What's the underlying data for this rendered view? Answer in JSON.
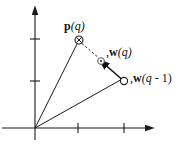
{
  "figure": {
    "type": "vector-diagram",
    "width": 182,
    "height": 154,
    "background": "#ffffff",
    "stroke_color": "#1a1a1a",
    "label_color": "#111111"
  },
  "axes": {
    "origin": {
      "x": 35,
      "y": 128
    },
    "x_axis": {
      "name": "horizontal-axis",
      "from": {
        "x": 2,
        "y": 128
      },
      "to": {
        "x": 152,
        "y": 128
      },
      "arrow": true,
      "ticks": [
        78,
        124
      ],
      "tick_half_length": 5
    },
    "y_axis": {
      "name": "vertical-axis",
      "from": {
        "x": 35,
        "y": 140
      },
      "to": {
        "x": 35,
        "y": 9
      },
      "arrow": true,
      "ticks": [
        39,
        81
      ],
      "tick_half_length": 5
    }
  },
  "markers": [
    {
      "id": "p-q",
      "glyph": "circle-with-cross",
      "x": 79,
      "y": 40,
      "radius": 4,
      "filled": false
    },
    {
      "id": "w-q",
      "glyph": "circle-with-dot",
      "x": 101,
      "y": 61,
      "radius": 3.2,
      "filled": false
    },
    {
      "id": "w-q-minus-1",
      "glyph": "open-circle",
      "x": 124,
      "y": 81,
      "radius": 3.4,
      "filled": false
    }
  ],
  "lines": [
    {
      "id": "origin-to-pq",
      "style": "solid",
      "from": {
        "x": 35,
        "y": 128
      },
      "to": {
        "x": 77,
        "y": 44
      }
    },
    {
      "id": "origin-to-wq-minus-1",
      "style": "solid",
      "from": {
        "x": 35,
        "y": 128
      },
      "to": {
        "x": 121,
        "y": 80
      }
    },
    {
      "id": "pq-to-wq-dashed",
      "style": "dashed",
      "from": {
        "x": 82,
        "y": 44
      },
      "to": {
        "x": 99,
        "y": 58
      }
    },
    {
      "id": "update-arrow",
      "style": "solid-arrow",
      "from": {
        "x": 121,
        "y": 79
      },
      "to": {
        "x": 104,
        "y": 64
      }
    }
  ],
  "labels": {
    "p_of_q": {
      "bold": "p",
      "italic": "(q)",
      "full_text": "p(q)"
    },
    "w_of_q": {
      "prefix": ",",
      "bold": "w",
      "italic": "(q)",
      "full_text": ",w(q)"
    },
    "w_of_q_minus_1": {
      "prefix": ",",
      "bold": "w",
      "italic": "(q",
      "tail": " - 1)",
      "full_text": ",w(q - 1)"
    }
  }
}
